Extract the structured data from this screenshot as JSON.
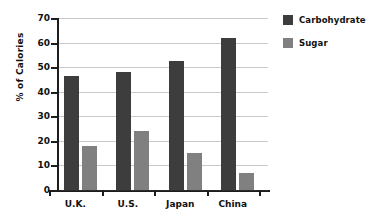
{
  "chart_data": {
    "type": "bar",
    "title": "",
    "xlabel": "",
    "ylabel": "% of Calories",
    "categories": [
      "U.K.",
      "U.S.",
      "Japan",
      "China"
    ],
    "series": [
      {
        "name": "Carbohydrate",
        "color": "#3d3d3d",
        "values": [
          46.5,
          48,
          52.5,
          62
        ]
      },
      {
        "name": "Sugar",
        "color": "#808080",
        "values": [
          17.8,
          24,
          15.2,
          6.8
        ]
      }
    ],
    "ylim": [
      0,
      70
    ],
    "ytick_labels": [
      "70",
      "60",
      "50",
      "40",
      "30",
      "20",
      "10",
      "0"
    ],
    "ytick_values": [
      70,
      60,
      50,
      40,
      30,
      20,
      10,
      0
    ],
    "grid": true,
    "legend_position": "right"
  },
  "legend": {
    "entries": [
      {
        "label": "Carbohydrate",
        "color": "#3d3d3d"
      },
      {
        "label": "Sugar",
        "color": "#808080"
      }
    ]
  },
  "axes": {
    "y_title": "% of Calories"
  }
}
